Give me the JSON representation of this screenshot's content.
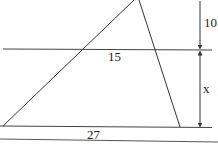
{
  "diagram": {
    "type": "geometry-similar-triangles",
    "labels": {
      "top_height": "10",
      "middle_segment": "15",
      "lower_height": "x",
      "base": "27"
    },
    "colors": {
      "line": "#333333",
      "background": "#ffffff"
    }
  }
}
